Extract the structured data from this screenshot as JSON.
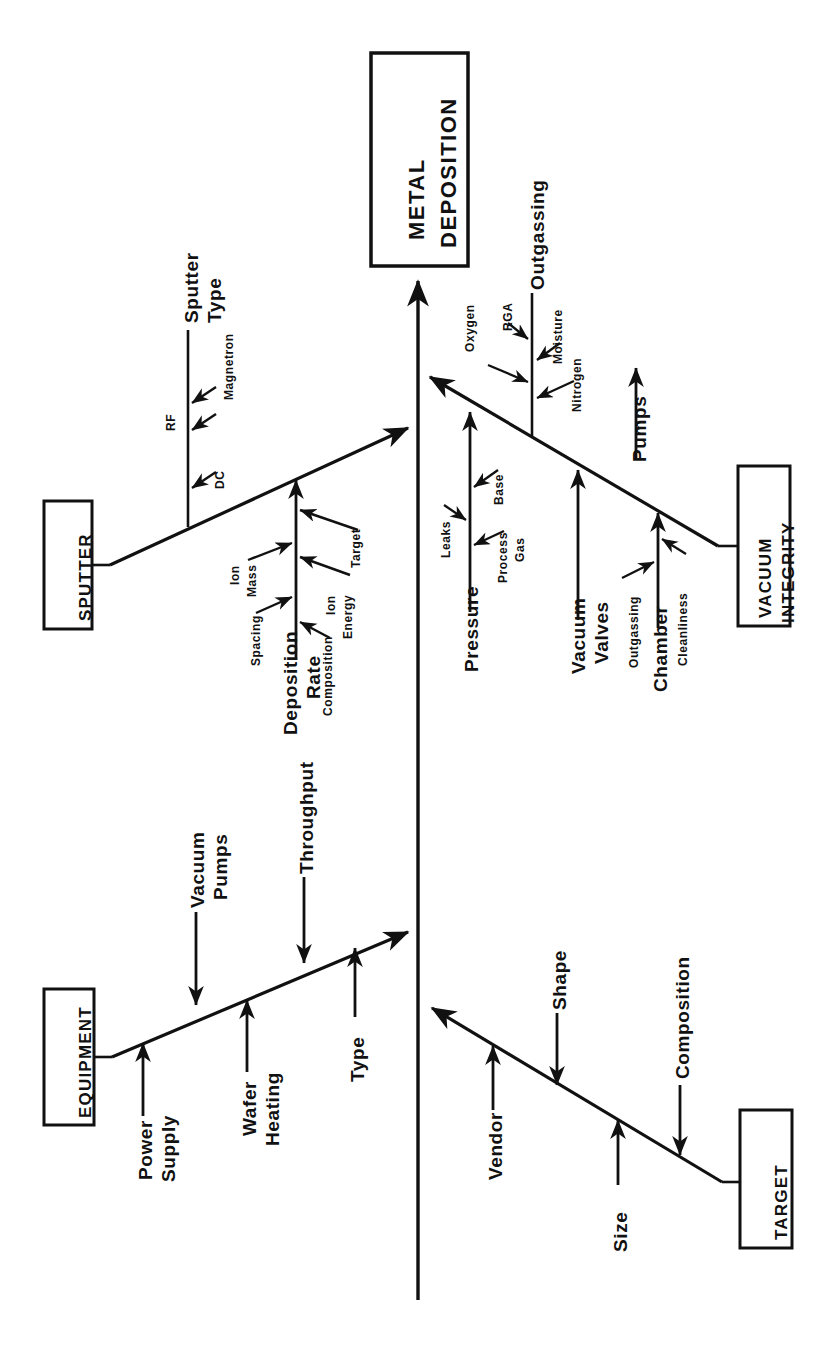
{
  "diagram": {
    "type": "fishbone-ishikawa",
    "orientation": "rotated-90-clockwise",
    "effect": {
      "line1": "METAL",
      "line2": "DEPOSITION"
    },
    "categories": [
      {
        "name": "SPUTTER",
        "box_label": "SPUTTER",
        "causes": [
          {
            "label": "Sputter Type",
            "label_line1": "Sputter",
            "label_line2": "Type",
            "sub_causes": [
              "RF",
              "DC",
              "Magnetron"
            ]
          },
          {
            "label": "Deposition Rate",
            "label_line1": "Deposition",
            "label_line2": "Rate",
            "sub_causes": [
              "Ion Mass",
              "Spacing",
              "Composition",
              "Ion Energy",
              "Target"
            ]
          }
        ]
      },
      {
        "name": "VACUUM INTEGRITY",
        "box_label_line1": "VACUUM",
        "box_label_line2": "INTEGRITY",
        "causes": [
          {
            "label": "Outgassing",
            "sub_causes": [
              "Oxygen",
              "RGA",
              "Moisture",
              "Nitrogen"
            ]
          },
          {
            "label": "Pressure",
            "sub_causes": [
              "Leaks",
              "Base",
              "Process Gas"
            ]
          },
          {
            "label": "Vacuum Valves",
            "label_line1": "Vacuum",
            "label_line2": "Valves",
            "sub_causes": []
          },
          {
            "label": "Pumps",
            "sub_causes": []
          },
          {
            "label": "Chamber",
            "sub_causes": [
              "Outgassing",
              "Cleanliness"
            ]
          }
        ]
      },
      {
        "name": "EQUIPMENT",
        "box_label": "EQUIPMENT",
        "causes": [
          {
            "label": "Power Supply",
            "label_line1": "Power",
            "label_line2": "Supply",
            "sub_causes": []
          },
          {
            "label": "Vacuum Pumps",
            "label_line1": "Vacuum",
            "label_line2": "Pumps",
            "sub_causes": []
          },
          {
            "label": "Wafer Heating",
            "label_line1": "Wafer",
            "label_line2": "Heating",
            "sub_causes": []
          },
          {
            "label": "Throughput",
            "sub_causes": []
          },
          {
            "label": "Type",
            "sub_causes": []
          }
        ]
      },
      {
        "name": "TARGET",
        "box_label": "TARGET",
        "causes": [
          {
            "label": "Vendor",
            "sub_causes": []
          },
          {
            "label": "Shape",
            "sub_causes": []
          },
          {
            "label": "Size",
            "sub_causes": []
          },
          {
            "label": "Composition",
            "sub_causes": []
          }
        ]
      }
    ],
    "colors": {
      "ink": "#111111",
      "background": "#ffffff"
    }
  },
  "labels": {
    "head_l1": "METAL",
    "head_l2": "DEPOSITION",
    "box_sputter": "SPUTTER",
    "box_vacuum_l1": "VACUUM",
    "box_vacuum_l2": "INTEGRITY",
    "box_equipment": "EQUIPMENT",
    "box_target": "TARGET",
    "sputter_type_l1": "Sputter",
    "sputter_type_l2": "Type",
    "rf": "RF",
    "dc": "DC",
    "magnetron": "Magnetron",
    "deposition_l1": "Deposition",
    "deposition_l2": "Rate",
    "ion_mass_l1": "Ion",
    "ion_mass_l2": "Mass",
    "spacing": "Spacing",
    "composition_dep": "Composition",
    "ion_energy_l1": "Ion",
    "ion_energy_l2": "Energy",
    "target_sub": "Target",
    "outgassing": "Outgassing",
    "oxygen": "Oxygen",
    "rga": "RGA",
    "moisture": "Moisture",
    "nitrogen": "Nitrogen",
    "pressure": "Pressure",
    "leaks": "Leaks",
    "base": "Base",
    "process_gas_l1": "Process",
    "process_gas_l2": "Gas",
    "vacuum_valves_l1": "Vacuum",
    "vacuum_valves_l2": "Valves",
    "pumps": "Pumps",
    "chamber": "Chamber",
    "chamber_outgassing": "Outgassing",
    "cleanliness": "Cleanliness",
    "power_supply_l1": "Power",
    "power_supply_l2": "Supply",
    "vacuum_pumps_l1": "Vacuum",
    "vacuum_pumps_l2": "Pumps",
    "wafer_heating_l1": "Wafer",
    "wafer_heating_l2": "Heating",
    "throughput": "Throughput",
    "type": "Type",
    "vendor": "Vendor",
    "shape": "Shape",
    "size": "Size",
    "composition_target": "Composition"
  }
}
